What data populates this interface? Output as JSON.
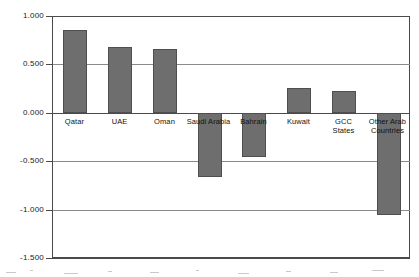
{
  "chart_data": {
    "type": "bar",
    "title": "",
    "subtitle": "",
    "xlabel": "",
    "ylabel": "",
    "categories": [
      "Qatar",
      "UAE",
      "Oman",
      "Saudi Arabia",
      "Bahrain",
      "Kuwait",
      "GCC\nStates",
      "Other Arab\nCountries"
    ],
    "values": [
      0.86,
      0.68,
      0.66,
      -0.66,
      -0.45,
      0.26,
      0.23,
      -1.05
    ],
    "ylim": [
      -1.5,
      1.0
    ],
    "ytick_values": [
      1.0,
      0.5,
      0.0,
      -0.5,
      -1.0,
      -1.5
    ],
    "ytick_labels": [
      "1.000",
      "0.500",
      "0.000",
      "-0.500",
      "-1.000",
      "-1.500"
    ],
    "grid": true,
    "legend": null,
    "legend_position": "none",
    "bar_color": "#6e6e6e",
    "bar_edge_color": "#4f4f4f",
    "axis_color": "#4a4a4a",
    "grid_color": "#8a8a8a",
    "background_color": "#ffffff"
  }
}
